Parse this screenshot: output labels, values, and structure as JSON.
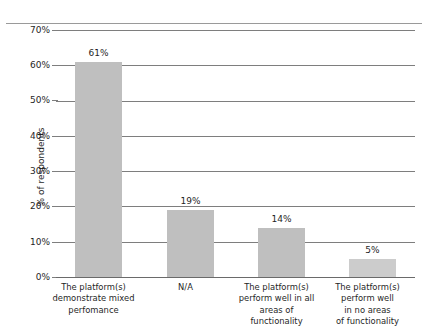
{
  "chart_data": {
    "type": "bar",
    "title": "",
    "xlabel": "",
    "ylabel": "% of respondents",
    "ylim": [
      0,
      70
    ],
    "grid": true,
    "legend": false,
    "legend_position": "none",
    "categories": [
      "The platform(s) demonstrate mixed perfomance",
      "N/A",
      "The platform(s) perform well in all areas of functionality",
      "The platform(s) perform well in no areas of functionality"
    ],
    "category_lines": [
      [
        "The platform(s)",
        "demonstrate mixed",
        "perfomance"
      ],
      [
        "N/A"
      ],
      [
        "The platform(s)",
        "perform well in all",
        "areas of",
        "functionality"
      ],
      [
        "The platform(s)",
        "perform well",
        "in no areas",
        "of functionality"
      ]
    ],
    "values": [
      61,
      19,
      14,
      5
    ],
    "value_labels": [
      "61%",
      "19%",
      "14%",
      "5%"
    ],
    "ytick_values": [
      70,
      60,
      50,
      40,
      30,
      20,
      10,
      0
    ],
    "ytick_labels": [
      "70%",
      "60%",
      "50%",
      "40%",
      "30%",
      "20%",
      "10%",
      "0%"
    ],
    "bar_color": "#bfbfbf",
    "grid_color": "#7e7e7e",
    "text_color": "#1f1f1f"
  },
  "header": {
    "title_fragment": ""
  }
}
